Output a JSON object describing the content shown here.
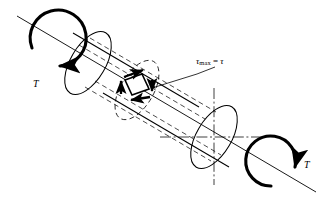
{
  "figure": {
    "type": "engineering-diagram",
    "background_color": "#ffffff",
    "line_color": "#000000",
    "width": 326,
    "height": 211
  },
  "labels": {
    "torque_left": "T",
    "torque_right": "T",
    "tau_symbol": "τ",
    "tau_subscript": "max",
    "tau_equals": "=",
    "tau_value": "τ",
    "tau_full": "τmax = τ"
  },
  "elements": {
    "axis_label": "shaft centerline axis",
    "cylinder_label": "circular shaft",
    "stress_element_label": "surface stress element",
    "cross_section_label": "right end cross-section",
    "dashed_section_label": "interior cross-section",
    "torque_arrow_left_label": "applied torque arrow (left end)",
    "torque_arrow_right_label": "applied torque arrow (right end)",
    "leader_label": "leader line to tau max annotation"
  },
  "geometry": {
    "axis_start": [
      18,
      17
    ],
    "axis_end": [
      316,
      192
    ],
    "cylinder_axis_angle_deg": 30.4,
    "left_cap_center": [
      88,
      63
    ],
    "right_cap_center": [
      214,
      137
    ],
    "cap_rx": 17,
    "cap_ry": 35,
    "element_center": [
      133,
      84
    ],
    "element_size": 21
  }
}
